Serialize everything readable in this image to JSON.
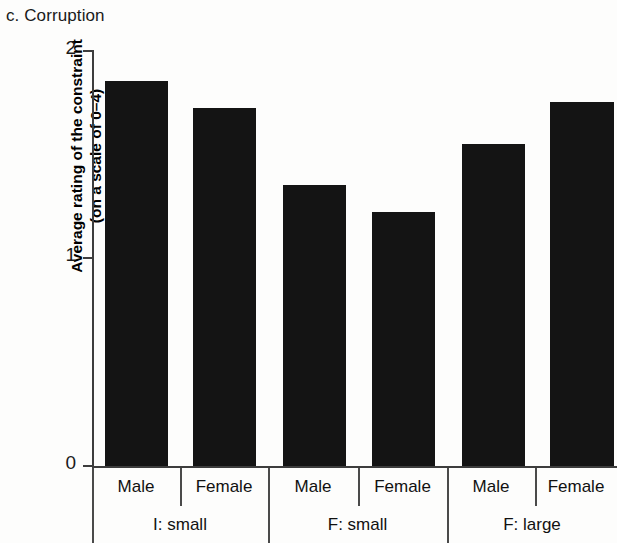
{
  "panel": {
    "title": "c. Corruption"
  },
  "axes": {
    "y_label_line1": "Average rating of the constraint",
    "y_label_line2": "(on a scale of 0–4)",
    "y_ticks": [
      "0",
      "1",
      "2"
    ]
  },
  "groups": [
    {
      "label": "I: small",
      "bars": [
        {
          "label": "Male"
        },
        {
          "label": "Female"
        }
      ]
    },
    {
      "label": "F: small",
      "bars": [
        {
          "label": "Male"
        },
        {
          "label": "Female"
        }
      ]
    },
    {
      "label": "F: large",
      "bars": [
        {
          "label": "Male"
        },
        {
          "label": "Female"
        }
      ]
    }
  ],
  "chart_data": {
    "type": "bar",
    "title": "c. Corruption",
    "xlabel": "",
    "ylabel": "Average rating of the constraint (on a scale of 0–4)",
    "ylim": [
      0,
      2
    ],
    "yticks": [
      0,
      1,
      2
    ],
    "grid": false,
    "legend": "none",
    "bar_color": "#141414",
    "categories": [
      "I: small / Male",
      "I: small / Female",
      "F: small / Male",
      "F: small / Female",
      "F: large / Male",
      "F: large / Female"
    ],
    "group_labels": [
      "I: small",
      "F: small",
      "F: large"
    ],
    "subgroup_labels": [
      "Male",
      "Female"
    ],
    "values": [
      1.85,
      1.72,
      1.35,
      1.22,
      1.55,
      1.75
    ]
  }
}
